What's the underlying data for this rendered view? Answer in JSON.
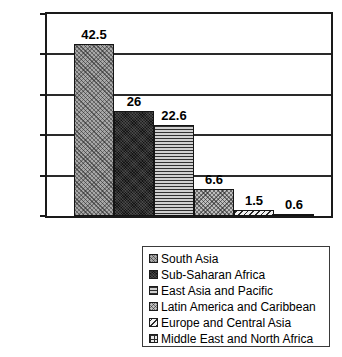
{
  "chart_data": {
    "type": "bar",
    "title": "",
    "subtitle": "",
    "xlabel": "",
    "ylabel": "",
    "ylim": [
      0,
      50
    ],
    "ytick_labels": [
      "0",
      "10",
      "20",
      "30",
      "40",
      "50"
    ],
    "ytick_values": [
      0,
      10,
      20,
      30,
      40,
      50
    ],
    "grid": true,
    "legend_position": "below-right",
    "categories": [
      "South Asia",
      "Sub-Saharan Africa",
      "East Asia and Pacific",
      "Latin America and Caribbean",
      "Europe and Central Asia",
      "Middle East and North Africa"
    ],
    "values": [
      42.5,
      26,
      22.6,
      6.6,
      1.5,
      0.6
    ],
    "data_labels": [
      "42.5",
      "26",
      "22.6",
      "6.6",
      "1.5",
      "0.6"
    ],
    "bars": [
      {
        "label": "South Asia",
        "value": 42.5,
        "data_label": "42.5",
        "pattern": "diagonal-crosshatch-gray",
        "fill_class": "pat-diag-gray"
      },
      {
        "label": "Sub-Saharan Africa",
        "value": 26,
        "data_label": "26",
        "pattern": "dense-dark",
        "fill_class": "pat-dense-dark"
      },
      {
        "label": "East Asia and Pacific",
        "value": 22.6,
        "data_label": "22.6",
        "pattern": "horizontal-lines",
        "fill_class": "pat-horiz-lines"
      },
      {
        "label": "Latin America and Caribbean",
        "value": 6.6,
        "data_label": "6.6",
        "pattern": "checker-medium",
        "fill_class": "pat-checker"
      },
      {
        "label": "Europe and Central Asia",
        "value": 1.5,
        "data_label": "1.5",
        "pattern": "light-sparse-dots",
        "fill_class": "pat-light-dots"
      },
      {
        "label": "Middle East and North Africa",
        "value": 0.6,
        "data_label": "0.6",
        "pattern": "light-grid",
        "fill_class": "pat-grid"
      }
    ],
    "colors": {
      "axis": "#1a1a1a",
      "gridline": "#2a2a2a",
      "text": "#000000",
      "background": "#ffffff",
      "legend_border": "#3a3a3a"
    }
  },
  "legend": {
    "entries": [
      {
        "label": "South Asia",
        "swatch": "diagonal-crosshatch-gray",
        "fill_class": "pat-diag-gray"
      },
      {
        "label": "Sub-Saharan Africa",
        "swatch": "dense-dark",
        "fill_class": "pat-dense-dark"
      },
      {
        "label": "East Asia and Pacific",
        "swatch": "horizontal-lines",
        "fill_class": "pat-horiz-lines"
      },
      {
        "label": "Latin America and Caribbean",
        "swatch": "checker-medium",
        "fill_class": "pat-checker"
      },
      {
        "label": "Europe and Central Asia",
        "swatch": "light-sparse-dots",
        "fill_class": "pat-light-dots"
      },
      {
        "label": "Middle East and North Africa",
        "swatch": "light-grid",
        "fill_class": "pat-grid"
      }
    ]
  }
}
